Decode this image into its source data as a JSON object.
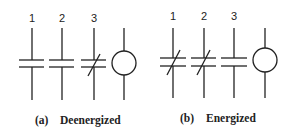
{
  "panels": [
    {
      "caption_prefix": "(a)",
      "caption": "Deenergized",
      "contacts": [
        {
          "label": "1",
          "state": "normally-open"
        },
        {
          "label": "2",
          "state": "normally-open"
        },
        {
          "label": "3",
          "state": "normally-closed"
        }
      ],
      "coil": "relay-coil"
    },
    {
      "caption_prefix": "(b)",
      "caption": "Energized",
      "contacts": [
        {
          "label": "1",
          "state": "closed"
        },
        {
          "label": "2",
          "state": "closed"
        },
        {
          "label": "3",
          "state": "open"
        }
      ],
      "coil": "relay-coil"
    }
  ],
  "colors": {
    "line": "#222222",
    "background": "#ffffff"
  }
}
